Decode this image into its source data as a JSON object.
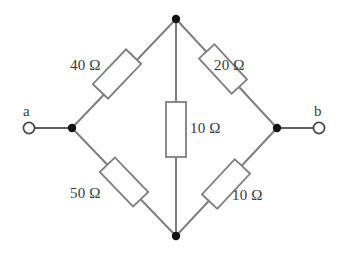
{
  "figure": {
    "type": "circuit-diagram",
    "background_color": "#ffffff",
    "wire_color": "#7e7e7e",
    "text_color": "#3a3a3a",
    "node_color": "#141414"
  },
  "terminals": [
    {
      "id": "a",
      "label": "a",
      "side": "left",
      "x": 28,
      "y": 128
    },
    {
      "id": "b",
      "label": "b",
      "side": "right",
      "x": 320,
      "y": 128
    }
  ],
  "nodes": [
    {
      "id": "top",
      "x": 176,
      "y": 19
    },
    {
      "id": "left",
      "x": 72,
      "y": 128
    },
    {
      "id": "right",
      "x": 277,
      "y": 128
    },
    {
      "id": "bottom",
      "x": 176,
      "y": 236
    }
  ],
  "components": [
    {
      "id": "r-top-left",
      "kind": "resistor",
      "value": "40",
      "unit": "Ω",
      "label": "40 Ω",
      "between": [
        "left",
        "top"
      ],
      "label_x": 70,
      "label_y": 58
    },
    {
      "id": "r-top-right",
      "kind": "resistor",
      "value": "20",
      "unit": "Ω",
      "label": "20 Ω",
      "between": [
        "top",
        "right"
      ],
      "label_x": 214,
      "label_y": 58
    },
    {
      "id": "r-middle",
      "kind": "resistor",
      "value": "10",
      "unit": "Ω",
      "label": "10 Ω",
      "between": [
        "top",
        "bottom"
      ],
      "label_x": 190,
      "label_y": 121
    },
    {
      "id": "r-bottom-left",
      "kind": "resistor",
      "value": "50",
      "unit": "Ω",
      "label": "50 Ω",
      "between": [
        "left",
        "bottom"
      ],
      "label_x": 70,
      "label_y": 186
    },
    {
      "id": "r-bottom-right",
      "kind": "resistor",
      "value": "10",
      "unit": "Ω",
      "label": "10 Ω",
      "between": [
        "bottom",
        "right"
      ],
      "label_x": 232,
      "label_y": 188
    }
  ]
}
